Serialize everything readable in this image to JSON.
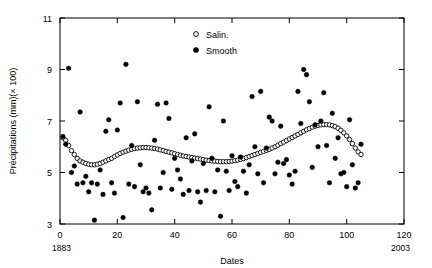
{
  "chart_data": {
    "type": "scatter",
    "title": "",
    "xlabel": "Dates",
    "ylabel": "Précipitations (mm)(× 100)",
    "xlim": [
      0,
      120
    ],
    "ylim": [
      3,
      11
    ],
    "xticks": [
      0,
      20,
      40,
      60,
      80,
      100,
      120
    ],
    "yticks": [
      3,
      5,
      7,
      9,
      11
    ],
    "grid": false,
    "corner_labels": {
      "left": "1883",
      "right": "2003"
    },
    "legend": {
      "position": "top-center",
      "entries": [
        {
          "name": "Salin.",
          "marker": "open-circle"
        },
        {
          "name": "Smooth",
          "marker": "filled-circle"
        }
      ]
    },
    "series": [
      {
        "name": "Salin.",
        "marker": "open-circle",
        "points": [
          [
            1,
            6.35
          ],
          [
            2,
            6.25
          ],
          [
            3,
            6.05
          ],
          [
            4,
            5.85
          ],
          [
            5,
            5.7
          ],
          [
            6,
            5.55
          ],
          [
            7,
            5.45
          ],
          [
            8,
            5.4
          ],
          [
            9,
            5.35
          ],
          [
            10,
            5.32
          ],
          [
            11,
            5.3
          ],
          [
            12,
            5.3
          ],
          [
            13,
            5.32
          ],
          [
            14,
            5.35
          ],
          [
            15,
            5.4
          ],
          [
            16,
            5.45
          ],
          [
            17,
            5.5
          ],
          [
            18,
            5.55
          ],
          [
            19,
            5.62
          ],
          [
            20,
            5.68
          ],
          [
            21,
            5.74
          ],
          [
            22,
            5.79
          ],
          [
            23,
            5.83
          ],
          [
            24,
            5.87
          ],
          [
            25,
            5.9
          ],
          [
            26,
            5.93
          ],
          [
            27,
            5.95
          ],
          [
            28,
            5.96
          ],
          [
            29,
            5.97
          ],
          [
            30,
            5.97
          ],
          [
            31,
            5.96
          ],
          [
            32,
            5.95
          ],
          [
            33,
            5.93
          ],
          [
            34,
            5.91
          ],
          [
            35,
            5.88
          ],
          [
            36,
            5.85
          ],
          [
            37,
            5.82
          ],
          [
            38,
            5.79
          ],
          [
            39,
            5.76
          ],
          [
            40,
            5.73
          ],
          [
            41,
            5.7
          ],
          [
            42,
            5.67
          ],
          [
            43,
            5.64
          ],
          [
            44,
            5.62
          ],
          [
            45,
            5.6
          ],
          [
            46,
            5.58
          ],
          [
            47,
            5.56
          ],
          [
            48,
            5.54
          ],
          [
            49,
            5.52
          ],
          [
            50,
            5.5
          ],
          [
            51,
            5.48
          ],
          [
            52,
            5.46
          ],
          [
            53,
            5.45
          ],
          [
            54,
            5.44
          ],
          [
            55,
            5.43
          ],
          [
            56,
            5.42
          ],
          [
            57,
            5.42
          ],
          [
            58,
            5.42
          ],
          [
            59,
            5.43
          ],
          [
            60,
            5.44
          ],
          [
            61,
            5.46
          ],
          [
            62,
            5.48
          ],
          [
            63,
            5.51
          ],
          [
            64,
            5.54
          ],
          [
            65,
            5.58
          ],
          [
            66,
            5.62
          ],
          [
            67,
            5.66
          ],
          [
            68,
            5.7
          ],
          [
            69,
            5.74
          ],
          [
            70,
            5.78
          ],
          [
            71,
            5.82
          ],
          [
            72,
            5.86
          ],
          [
            73,
            5.9
          ],
          [
            74,
            5.95
          ],
          [
            75,
            6.0
          ],
          [
            76,
            6.06
          ],
          [
            77,
            6.12
          ],
          [
            78,
            6.18
          ],
          [
            79,
            6.24
          ],
          [
            80,
            6.3
          ],
          [
            81,
            6.36
          ],
          [
            82,
            6.42
          ],
          [
            83,
            6.48
          ],
          [
            84,
            6.54
          ],
          [
            85,
            6.6
          ],
          [
            86,
            6.66
          ],
          [
            87,
            6.71
          ],
          [
            88,
            6.76
          ],
          [
            89,
            6.8
          ],
          [
            90,
            6.83
          ],
          [
            91,
            6.85
          ],
          [
            92,
            6.86
          ],
          [
            93,
            6.86
          ],
          [
            94,
            6.85
          ],
          [
            95,
            6.82
          ],
          [
            96,
            6.78
          ],
          [
            97,
            6.72
          ],
          [
            98,
            6.64
          ],
          [
            99,
            6.54
          ],
          [
            100,
            6.42
          ],
          [
            101,
            6.28
          ],
          [
            102,
            6.12
          ],
          [
            103,
            5.95
          ],
          [
            104,
            5.8
          ],
          [
            105,
            5.7
          ]
        ]
      },
      {
        "name": "Smooth",
        "marker": "filled-circle",
        "points": [
          [
            1,
            6.4
          ],
          [
            2,
            6.1
          ],
          [
            3,
            9.05
          ],
          [
            4,
            5.0
          ],
          [
            5,
            5.25
          ],
          [
            6,
            4.55
          ],
          [
            7,
            7.35
          ],
          [
            8,
            4.6
          ],
          [
            9,
            4.85
          ],
          [
            10,
            4.25
          ],
          [
            11,
            4.6
          ],
          [
            12,
            3.15
          ],
          [
            13,
            4.55
          ],
          [
            14,
            5.1
          ],
          [
            15,
            4.15
          ],
          [
            16,
            6.6
          ],
          [
            17,
            7.05
          ],
          [
            18,
            4.6
          ],
          [
            19,
            4.2
          ],
          [
            20,
            6.65
          ],
          [
            21,
            7.7
          ],
          [
            22,
            3.25
          ],
          [
            23,
            9.2
          ],
          [
            24,
            4.55
          ],
          [
            25,
            6.05
          ],
          [
            26,
            4.45
          ],
          [
            27,
            7.75
          ],
          [
            28,
            5.3
          ],
          [
            29,
            4.25
          ],
          [
            30,
            4.4
          ],
          [
            31,
            4.2
          ],
          [
            32,
            3.55
          ],
          [
            33,
            6.25
          ],
          [
            34,
            7.65
          ],
          [
            35,
            4.4
          ],
          [
            36,
            5.0
          ],
          [
            37,
            7.7
          ],
          [
            38,
            7.1
          ],
          [
            39,
            4.35
          ],
          [
            40,
            5.55
          ],
          [
            41,
            5.1
          ],
          [
            42,
            4.75
          ],
          [
            43,
            4.15
          ],
          [
            44,
            6.35
          ],
          [
            45,
            4.3
          ],
          [
            46,
            5.45
          ],
          [
            47,
            6.5
          ],
          [
            48,
            4.25
          ],
          [
            49,
            3.85
          ],
          [
            50,
            5.35
          ],
          [
            51,
            4.3
          ],
          [
            52,
            7.55
          ],
          [
            53,
            5.55
          ],
          [
            54,
            4.25
          ],
          [
            55,
            5.1
          ],
          [
            56,
            3.3
          ],
          [
            57,
            7.0
          ],
          [
            58,
            5.05
          ],
          [
            59,
            4.3
          ],
          [
            60,
            5.65
          ],
          [
            61,
            4.65
          ],
          [
            62,
            4.45
          ],
          [
            63,
            5.6
          ],
          [
            64,
            5.05
          ],
          [
            65,
            4.2
          ],
          [
            66,
            5.3
          ],
          [
            67,
            7.95
          ],
          [
            68,
            6.0
          ],
          [
            69,
            4.95
          ],
          [
            70,
            8.15
          ],
          [
            71,
            4.6
          ],
          [
            72,
            5.95
          ],
          [
            73,
            7.15
          ],
          [
            74,
            7.0
          ],
          [
            75,
            4.95
          ],
          [
            76,
            5.4
          ],
          [
            77,
            6.8
          ],
          [
            78,
            5.35
          ],
          [
            79,
            5.5
          ],
          [
            80,
            4.9
          ],
          [
            81,
            4.55
          ],
          [
            82,
            5.05
          ],
          [
            83,
            8.15
          ],
          [
            84,
            6.9
          ],
          [
            85,
            9.0
          ],
          [
            86,
            8.8
          ],
          [
            87,
            7.75
          ],
          [
            88,
            5.2
          ],
          [
            89,
            6.85
          ],
          [
            90,
            6.0
          ],
          [
            91,
            7.0
          ],
          [
            92,
            8.1
          ],
          [
            93,
            6.05
          ],
          [
            94,
            4.6
          ],
          [
            95,
            7.3
          ],
          [
            96,
            5.55
          ],
          [
            97,
            6.35
          ],
          [
            98,
            4.95
          ],
          [
            99,
            5.0
          ],
          [
            100,
            4.45
          ],
          [
            101,
            7.05
          ],
          [
            102,
            5.3
          ],
          [
            103,
            4.4
          ],
          [
            104,
            4.6
          ],
          [
            105,
            6.1
          ]
        ]
      }
    ]
  }
}
